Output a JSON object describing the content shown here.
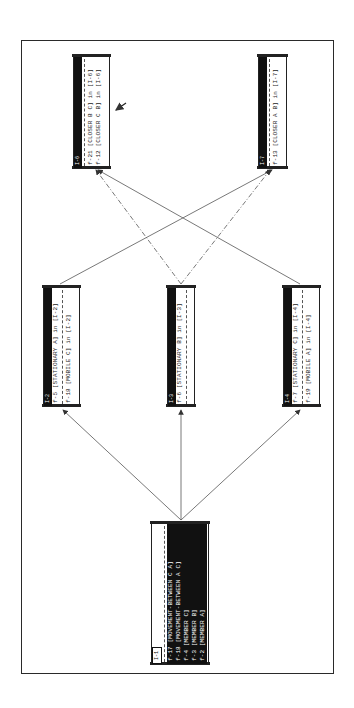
{
  "diagram": {
    "orientation": "rotated-90-ccw",
    "nodes": [
      {
        "id": "I-1",
        "facts": [
          "f-17 [MOVEMENT-BETWEEN C A]",
          "f-18 [MOVEMENT-BETWEEN A C]",
          "f-4 [MEMBER C]",
          "f-3 [MEMBER B]",
          "f-2 [MEMBER A]"
        ]
      },
      {
        "id": "I-2",
        "facts": [
          "f-5 [STATIONARY A] in [I-2]",
          "f-18 [MOBILE C] in [I-2]"
        ]
      },
      {
        "id": "I-3",
        "facts": [
          "f-6 [STATIONARY B] in [I-3]"
        ]
      },
      {
        "id": "I-4",
        "facts": [
          "f-7 [STATIONARY C] in [I-4]",
          "f-19 [MOBILE A] in [I-4]"
        ]
      },
      {
        "id": "I-6",
        "facts": [
          "f-21 [CLOSER B C] in [I-6]",
          "f-12 [CLOSER C B] in [I-6]"
        ]
      },
      {
        "id": "I-7",
        "facts": [
          "f-13 [CLOSER A B] in [I-7]"
        ]
      }
    ],
    "edges": [
      {
        "from": "I-1",
        "to": "I-2",
        "style": "solid"
      },
      {
        "from": "I-1",
        "to": "I-3",
        "style": "solid"
      },
      {
        "from": "I-1",
        "to": "I-4",
        "style": "solid"
      },
      {
        "from": "I-2",
        "to": "I-7",
        "style": "solid"
      },
      {
        "from": "I-3",
        "to": "I-6",
        "style": "dashed"
      },
      {
        "from": "I-3",
        "to": "I-7",
        "style": "dashed"
      },
      {
        "from": "I-4",
        "to": "I-6",
        "style": "solid"
      }
    ],
    "annotation": "arrow pointing at I-6",
    "colors": {
      "ink": "#1a1a1a",
      "background": "#ffffff",
      "edge": "#555555"
    }
  }
}
